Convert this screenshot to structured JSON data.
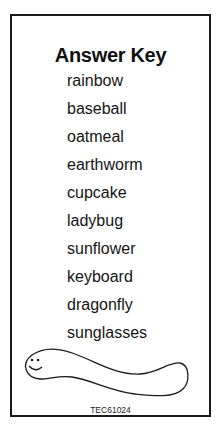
{
  "answer_key": {
    "title": "Answer Key",
    "words": [
      "rainbow",
      "baseball",
      "oatmeal",
      "earthworm",
      "cupcake",
      "ladybug",
      "sunflower",
      "keyboard",
      "dragonfly",
      "sunglasses"
    ],
    "illustration": "smiling-worm",
    "code": "TEC61024"
  }
}
